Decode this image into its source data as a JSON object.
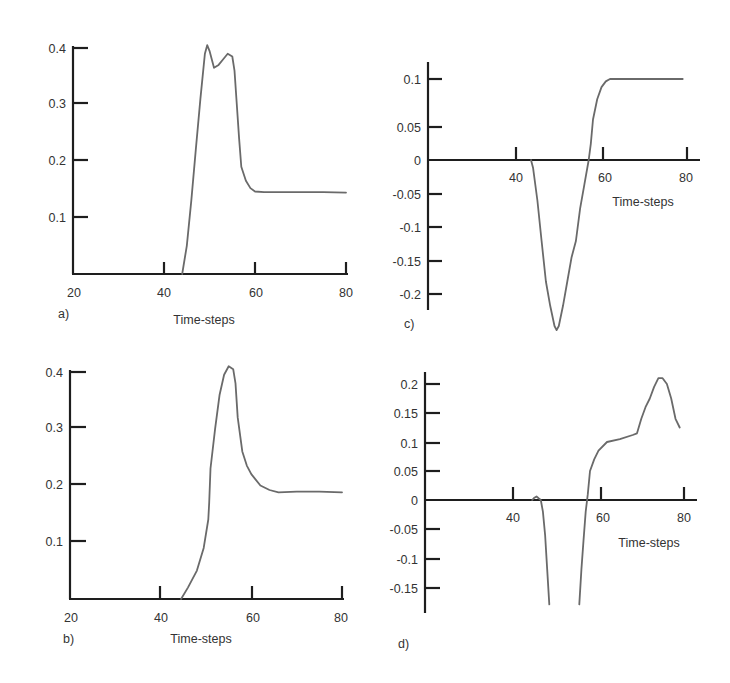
{
  "chart_data": [
    {
      "panel": "a)",
      "type": "line",
      "xlabel": "Time-steps",
      "ylabel": "",
      "xlim": [
        20,
        80
      ],
      "ylim": [
        0,
        0.4
      ],
      "xticks": [
        20,
        40,
        60,
        80
      ],
      "yticks": [
        0.1,
        0.2,
        0.3,
        0.4
      ],
      "grid": false,
      "x": [
        44,
        45,
        46,
        47,
        48,
        49,
        49.5,
        50,
        51,
        52,
        53,
        54,
        55,
        55.5,
        56,
        56.5,
        57,
        58,
        59,
        60,
        62,
        65,
        70,
        75,
        80
      ],
      "values": [
        0,
        0.05,
        0.13,
        0.22,
        0.31,
        0.39,
        0.405,
        0.395,
        0.365,
        0.37,
        0.38,
        0.39,
        0.385,
        0.36,
        0.3,
        0.24,
        0.19,
        0.165,
        0.152,
        0.146,
        0.145,
        0.145,
        0.145,
        0.145,
        0.144
      ]
    },
    {
      "panel": "c)",
      "type": "line",
      "xlabel": "Time-steps",
      "ylabel": "",
      "xlim": [
        20,
        80
      ],
      "ylim": [
        -0.21,
        0.11
      ],
      "xticks": [
        40,
        60,
        80
      ],
      "yticks": [
        0.1,
        0.05,
        0,
        -0.05,
        -0.1,
        -0.15,
        -0.2
      ],
      "grid": false,
      "x": [
        43.5,
        44,
        45,
        46,
        47,
        48,
        49,
        49.5,
        50,
        51,
        52,
        53,
        54,
        55,
        56,
        57,
        57.5,
        58,
        59,
        60,
        61,
        62,
        65,
        70,
        75,
        79
      ],
      "values": [
        0,
        -0.01,
        -0.05,
        -0.1,
        -0.15,
        -0.18,
        -0.205,
        -0.21,
        -0.205,
        -0.18,
        -0.15,
        -0.12,
        -0.1,
        -0.06,
        -0.03,
        0.0,
        0.02,
        0.05,
        0.075,
        0.09,
        0.097,
        0.1,
        0.1,
        0.1,
        0.1,
        0.1
      ]
    },
    {
      "panel": "b)",
      "type": "line",
      "xlabel": "Time-steps",
      "ylabel": "",
      "xlim": [
        20,
        80
      ],
      "ylim": [
        0,
        0.4
      ],
      "xticks": [
        20,
        40,
        60,
        80
      ],
      "yticks": [
        0.1,
        0.2,
        0.3,
        0.4
      ],
      "grid": false,
      "x": [
        44.5,
        46,
        48,
        49.5,
        50.5,
        50.7,
        51,
        52,
        53,
        54,
        55,
        56,
        56.5,
        57,
        58,
        59,
        60,
        62,
        64,
        66,
        70,
        75,
        80
      ],
      "values": [
        0,
        0.02,
        0.05,
        0.09,
        0.14,
        0.17,
        0.23,
        0.3,
        0.36,
        0.395,
        0.41,
        0.405,
        0.38,
        0.32,
        0.26,
        0.235,
        0.22,
        0.2,
        0.192,
        0.188,
        0.189,
        0.189,
        0.188
      ]
    },
    {
      "panel": "d)",
      "type": "line",
      "xlabel": "Time-steps",
      "ylabel": "",
      "xlim": [
        20,
        80
      ],
      "ylim": [
        -0.18,
        0.21
      ],
      "xticks": [
        40,
        60,
        80
      ],
      "yticks": [
        0.2,
        0.15,
        0.1,
        0.05,
        0,
        -0.05,
        -0.1,
        -0.15
      ],
      "grid": false,
      "x": [
        44.5,
        45,
        45.5,
        46,
        46.5,
        47,
        47.5,
        48,
        48.5,
        "gap",
        55.5,
        56,
        56.5,
        57,
        57.5,
        58,
        59,
        60,
        62,
        65,
        68,
        69,
        70,
        71,
        72,
        73,
        74,
        75,
        76,
        77,
        78,
        79
      ],
      "values": [
        0,
        0.004,
        0.006,
        0.003,
        0,
        -0.02,
        -0.06,
        -0.12,
        -0.18,
        null,
        -0.18,
        -0.12,
        -0.07,
        -0.02,
        0.01,
        0.05,
        0.07,
        0.085,
        0.1,
        0.105,
        0.112,
        0.115,
        0.14,
        0.16,
        0.175,
        0.195,
        0.21,
        0.21,
        0.2,
        0.175,
        0.14,
        0.125
      ]
    }
  ],
  "panels": {
    "a": {
      "label": "a)",
      "xlabel": "Time-steps",
      "xticks": [
        "20",
        "40",
        "60",
        "80"
      ],
      "yticks": [
        "0.4",
        "0.3",
        "0.2",
        "0.1"
      ]
    },
    "c": {
      "label": "c)",
      "xlabel": "Time-steps",
      "xticks": [
        "40",
        "60",
        "80"
      ],
      "yticks": [
        "0.1",
        "0.05",
        "0",
        "-0.05",
        "-0.1",
        "-0.15",
        "-0.2"
      ]
    },
    "b": {
      "label": "b)",
      "xlabel": "Time-steps",
      "xticks": [
        "20",
        "40",
        "60",
        "80"
      ],
      "yticks": [
        "0.4",
        "0.3",
        "0.2",
        "0.1"
      ]
    },
    "d": {
      "label": "d)",
      "xlabel": "Time-steps",
      "xticks": [
        "40",
        "60",
        "80"
      ],
      "yticks": [
        "0.2",
        "0.15",
        "0.1",
        "0.05",
        "0",
        "-0.05",
        "-0.1",
        "-0.15"
      ]
    }
  }
}
